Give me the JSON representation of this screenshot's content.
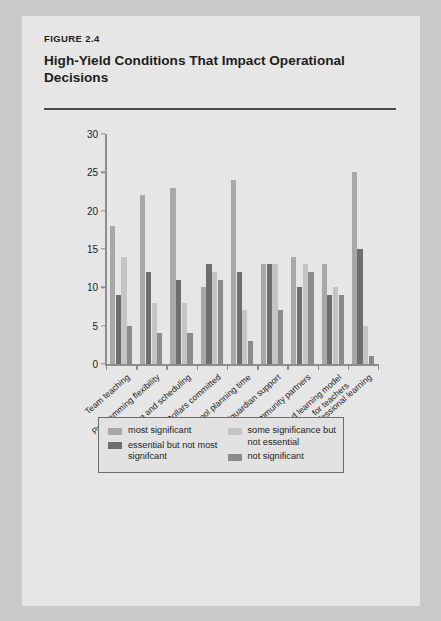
{
  "figure": {
    "label": "FIGURE 2.4",
    "title": "High-Yield Conditions That Impact Operational Decisions"
  },
  "chart_data": {
    "type": "bar",
    "title": "High-Yield Conditions That Impact Operational Decisions",
    "xlabel": "",
    "ylabel": "",
    "ylim": [
      0,
      30
    ],
    "yticks": [
      0,
      5,
      10,
      15,
      20,
      25,
      30
    ],
    "grid": false,
    "legend_position": "bottom",
    "categories": [
      "Team teaching",
      "Programming flexibility",
      "Timetabling and scheduling",
      "Dollars committed",
      "Teacher/school planning time",
      "Parental/guardian support",
      "Community partners",
      "Blended learning model for teachers",
      "Ongoing professional learning"
    ],
    "category_lines": [
      [
        "Team teaching"
      ],
      [
        "Programming flexibility"
      ],
      [
        "Timetabling and scheduling"
      ],
      [
        "Dollars committed"
      ],
      [
        "Teacher/school planning time"
      ],
      [
        "Parental/guardian support"
      ],
      [
        "Community partners"
      ],
      [
        "Blended learning model",
        "for teachers"
      ],
      [
        "Ongoing professional learning"
      ]
    ],
    "series": [
      {
        "name": "most significant",
        "color": "#a8a8a8",
        "values": [
          18,
          22,
          23,
          10,
          24,
          13,
          14,
          13,
          25
        ]
      },
      {
        "name": "essential but not most signifcant",
        "color": "#6e6e6e",
        "values": [
          9,
          12,
          11,
          13,
          12,
          13,
          10,
          9,
          15
        ]
      },
      {
        "name": "some significance but not essential",
        "color": "#c4c4c4",
        "values": [
          14,
          8,
          8,
          12,
          7,
          13,
          13,
          10,
          5
        ]
      },
      {
        "name": "not significant",
        "color": "#8b8b8b",
        "values": [
          5,
          4,
          4,
          11,
          3,
          7,
          12,
          9,
          1
        ]
      }
    ]
  },
  "legend": {
    "items": [
      {
        "label": "most significant",
        "color": "#a8a8a8"
      },
      {
        "label": "essential but not most signifcant",
        "color": "#6e6e6e"
      },
      {
        "label": "some significance but not essential",
        "color": "#c4c4c4"
      },
      {
        "label": "not significant",
        "color": "#8b8b8b"
      }
    ],
    "item_lines": [
      [
        "most significant"
      ],
      [
        "essential but not",
        "most signifcant"
      ],
      [
        "some significance",
        "but not essential"
      ],
      [
        "not significant"
      ]
    ]
  },
  "colors": {
    "page_background": "#e6e6e6",
    "outer_background": "#c9c9c9",
    "text": "#1d1d1d",
    "axis": "#8d8d8d",
    "rule": "#4a4a4a"
  }
}
